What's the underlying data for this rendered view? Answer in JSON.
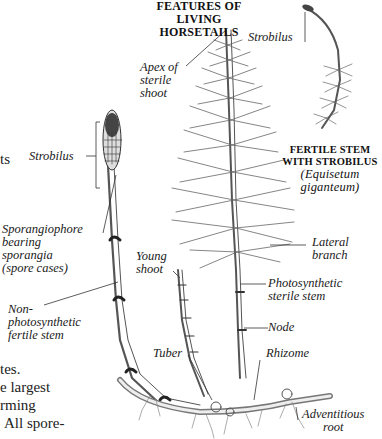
{
  "figure": {
    "title_line1": "FEATURES OF LIVING",
    "title_line2": "HORSETAILS",
    "inset": {
      "strobilus_label": "Strobilus",
      "caption_line1": "FERTILE STEM",
      "caption_line2": "WITH STROBILUS",
      "species_line1": "(Equisetum",
      "species_line2": "giganteum)"
    },
    "labels": {
      "apex": [
        "Apex of",
        "sterile",
        "shoot"
      ],
      "strobilus": "Strobilus",
      "sporangiophore": [
        "Sporangiophore",
        "bearing",
        "sporangia",
        "(spore cases)"
      ],
      "young_shoot": [
        "Young",
        "shoot"
      ],
      "lateral_branch": [
        "Lateral",
        "branch"
      ],
      "photosynthetic": [
        "Photosynthetic",
        "sterile stem"
      ],
      "node": "Node",
      "non_photosynthetic": [
        "Non-",
        "photosynthetic",
        "fertile stem"
      ],
      "tuber": "Tuber",
      "rhizome": "Rhizome",
      "adventitious": [
        "Adventitious",
        "root"
      ]
    },
    "colors": {
      "ink": "#1a1a1a",
      "stem": "#6b6b6b",
      "background": "#ffffff"
    }
  },
  "side_text": {
    "line_ts": "ts",
    "line_tes": "tes.",
    "line_largest": "e largest",
    "line_rming": "rming",
    "line_spore": "All spore-"
  }
}
